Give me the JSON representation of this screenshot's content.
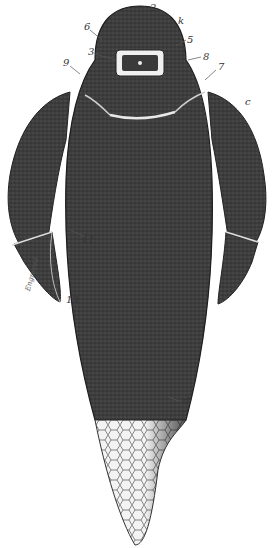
{
  "figure": {
    "colors": {
      "body": "#3a3a3a",
      "body_dark": "#262626",
      "plate_highlight": "#e8e8e8",
      "tail_mesh": "#f2f2f2",
      "label": "#333333"
    }
  },
  "labels": [
    {
      "id": "2",
      "text": "2",
      "x": 150,
      "y": 3
    },
    {
      "id": "k",
      "text": "k",
      "x": 178,
      "y": 18
    },
    {
      "id": "6",
      "text": "6",
      "x": 84,
      "y": 22
    },
    {
      "id": "5a",
      "text": "5",
      "x": 187,
      "y": 37
    },
    {
      "id": "3",
      "text": "3",
      "x": 88,
      "y": 47
    },
    {
      "id": "8",
      "text": "8",
      "x": 203,
      "y": 53
    },
    {
      "id": "5b",
      "text": "5",
      "x": 203,
      "y": 70
    },
    {
      "id": "9",
      "text": "9",
      "x": 63,
      "y": 58
    },
    {
      "id": "7",
      "text": "7",
      "x": 218,
      "y": 64
    },
    {
      "id": "c",
      "text": "c",
      "x": 245,
      "y": 97
    },
    {
      "id": "11",
      "text": "11",
      "x": 82,
      "y": 235
    },
    {
      "id": "13",
      "text": "13",
      "x": 66,
      "y": 295
    },
    {
      "id": "d",
      "text": "d",
      "x": 183,
      "y": 398
    }
  ],
  "signature": "Engraved"
}
